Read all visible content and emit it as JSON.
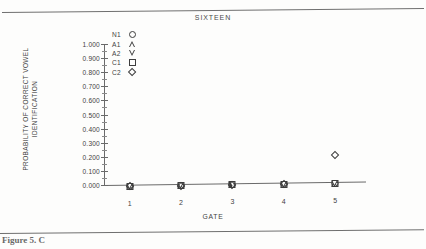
{
  "figure": {
    "title": "SIXTEEN",
    "caption": "Figure 5. C"
  },
  "chart_data": {
    "type": "scatter",
    "title": "SIXTEEN",
    "xlabel": "GATE",
    "ylabel": "PROBABILITY OF CORRECT VOWEL IDENTIFICATION",
    "ylabel_lines": [
      "PROBABILITY OF CORRECT VOWEL",
      "IDENTIFICATION"
    ],
    "categories": [
      "1",
      "2",
      "3",
      "4",
      "5"
    ],
    "x": [
      1,
      2,
      3,
      4,
      5
    ],
    "xlim": [
      0.5,
      5.6
    ],
    "ylim": [
      0.0,
      1.0
    ],
    "ytick_labels": [
      "0.000",
      "0.100",
      "0.200",
      "0.300",
      "0.400",
      "0.500",
      "0.600",
      "0.700",
      "0.800",
      "0.900",
      "1.000"
    ],
    "ytick_values": [
      0.0,
      0.1,
      0.2,
      0.3,
      0.4,
      0.5,
      0.6,
      0.7,
      0.8,
      0.9,
      1.0
    ],
    "minor_ticks": true,
    "grid": false,
    "legend_position": "upper-left-inside",
    "series": [
      {
        "name": "N1",
        "marker": "circle",
        "values": [
          0.0,
          0.0,
          0.0,
          0.0,
          0.0
        ]
      },
      {
        "name": "A1",
        "marker": "triangle-up",
        "values": [
          0.0,
          0.0,
          0.0,
          0.0,
          0.0
        ]
      },
      {
        "name": "A2",
        "marker": "triangle-down",
        "values": [
          0.0,
          0.0,
          0.0,
          0.0,
          0.0
        ]
      },
      {
        "name": "C1",
        "marker": "square",
        "values": [
          0.0,
          0.0,
          0.0,
          0.0,
          0.0
        ]
      },
      {
        "name": "C2",
        "marker": "diamond",
        "values": [
          0.0,
          0.0,
          0.0,
          0.0,
          0.205
        ]
      }
    ]
  }
}
